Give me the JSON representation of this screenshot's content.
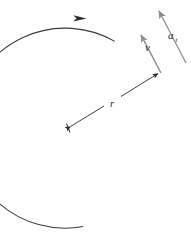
{
  "figure": {
    "type": "physics-vector-diagram",
    "canvas": {
      "width": 191,
      "height": 248,
      "background": "#ffffff"
    },
    "colors": {
      "arc": "#3a3a3a",
      "radius_line": "#2b2b2b",
      "velocity_vector": "#8a8a8a",
      "acceleration_vector": "#8a8a8a",
      "label": "#2b2b2b"
    },
    "circle": {
      "center_x": 68,
      "center_y": 128,
      "radius": 100,
      "arc_start_deg": 212,
      "arc_end_deg": 62,
      "direction": "clockwise"
    },
    "point_on_circle": {
      "x": 160,
      "y": 72
    },
    "labels": {
      "radius": {
        "text": "r",
        "subscript": "",
        "x": 113,
        "y": 106
      },
      "velocity": {
        "text": "v",
        "subscript": "",
        "x": 148,
        "y": 48
      },
      "acceleration": {
        "text": "a",
        "subscript": "t",
        "x": 171,
        "y": 38
      }
    },
    "vectors": [
      {
        "name": "velocity",
        "label": "v",
        "from_x": 161,
        "from_y": 73,
        "to_x": 139,
        "to_y": 31,
        "color": "#8a8a8a"
      },
      {
        "name": "tangential-acceleration",
        "label": "a_t",
        "from_x": 186,
        "from_y": 63,
        "to_x": 157,
        "to_y": 6,
        "color": "#8a8a8a"
      },
      {
        "name": "radius",
        "label": "r",
        "from_x": 68,
        "from_y": 128,
        "to_x": 160,
        "to_y": 72,
        "color": "#2b2b2b"
      }
    ],
    "arc_direction_marker": {
      "x": 83,
      "y": 19,
      "direction": "clockwise"
    }
  }
}
